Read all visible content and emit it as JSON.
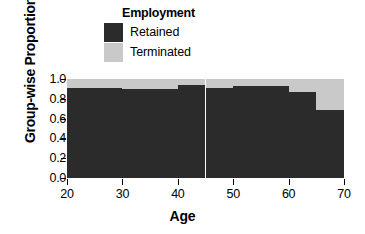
{
  "chart_data": {
    "type": "bar",
    "title": "",
    "xlabel": "Age",
    "ylabel": "Group-wise Proportion",
    "xlim": [
      20,
      70
    ],
    "ylim": [
      0.0,
      1.0
    ],
    "grid": false,
    "legend": {
      "title": "Employment",
      "position": "top",
      "entries": [
        {
          "label": "Retained",
          "color": "#2b2b2b"
        },
        {
          "label": "Terminated",
          "color": "#c9c9c9"
        }
      ]
    },
    "xticks": [
      "20",
      "30",
      "40",
      "50",
      "60",
      "70"
    ],
    "xtick_values": [
      20,
      30,
      40,
      50,
      60,
      70
    ],
    "yticks": [
      "0.0",
      "0.2",
      "0.4",
      "0.6",
      "0.8",
      "1.0"
    ],
    "ytick_values": [
      0.0,
      0.2,
      0.4,
      0.6,
      0.8,
      1.0
    ],
    "stacked": true,
    "categories": [
      "20-25",
      "25-30",
      "30-35",
      "35-40",
      "40-45",
      "45-50",
      "50-55",
      "55-60",
      "60-65",
      "65-70"
    ],
    "bin_edges": [
      20,
      25,
      30,
      35,
      40,
      45,
      50,
      55,
      60,
      65,
      70
    ],
    "series": [
      {
        "name": "Retained",
        "color": "#2b2b2b",
        "values": [
          0.91,
          0.91,
          0.9,
          0.9,
          0.94,
          0.91,
          0.93,
          0.93,
          0.87,
          0.69
        ]
      },
      {
        "name": "Terminated",
        "color": "#c9c9c9",
        "values": [
          0.09,
          0.09,
          0.1,
          0.1,
          0.06,
          0.09,
          0.07,
          0.07,
          0.13,
          0.31
        ]
      }
    ]
  }
}
